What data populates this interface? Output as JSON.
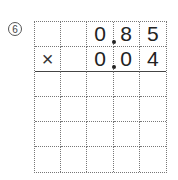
{
  "problem": {
    "number_label": "6",
    "operator": "×",
    "multiplicand": {
      "digits": [
        "",
        "",
        "0",
        "8",
        "5"
      ],
      "decimal_after_col": 2
    },
    "multiplier": {
      "digits": [
        "",
        "",
        "0",
        "0",
        "4"
      ],
      "decimal_after_col": 2
    },
    "grid": {
      "columns": 5,
      "rows": 6,
      "answer_rows_empty": 4
    }
  }
}
